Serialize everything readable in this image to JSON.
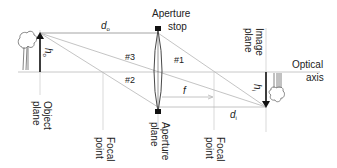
{
  "colors": {
    "ray": "#b5b5b5",
    "guide": "#cfcfcf",
    "arrow": "#111111",
    "text": "#222222"
  },
  "labels": {
    "aperture_stop_line1": "Aperture",
    "aperture_stop_line2": "stop",
    "image_plane_line1": "Image",
    "image_plane_line2": "plane",
    "optical_axis_line1": "Optical",
    "optical_axis_line2": "axis",
    "object_plane_line1": "Object",
    "object_plane_line2": "plane",
    "focal_point_left_line1": "Focal",
    "focal_point_left_line2": "point",
    "aperture_plane_line1": "Aperture",
    "aperture_plane_line2": "plane",
    "focal_point_right_line1": "Focal",
    "focal_point_right_line2": "point",
    "do_main": "d",
    "do_sub": "o",
    "di_main": "d",
    "di_sub": "i",
    "ho_main": "h",
    "ho_sub": "o",
    "hi_main": "h",
    "hi_sub": "i",
    "f": "f",
    "ray1": "#1",
    "ray2": "#2",
    "ray3": "#3"
  },
  "icons": {
    "object": "tree-icon",
    "image": "inverted-tree-icon"
  }
}
